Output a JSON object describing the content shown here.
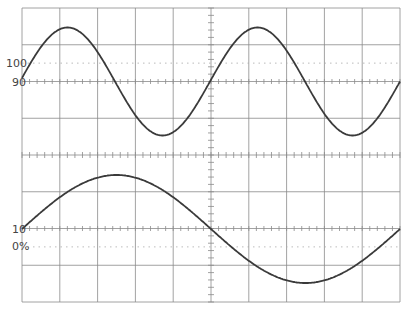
{
  "diagram": {
    "type": "oscilloscope-graticule",
    "grid": {
      "columns": 10,
      "rows": 8,
      "color": "#8a8a8a"
    },
    "labels": {
      "top_100": "100",
      "top_90": "90",
      "bottom_10": "10",
      "bottom_0": "0%"
    },
    "traces": [
      {
        "name": "upper-trace",
        "shape": "sine",
        "cycles_shown": 2,
        "color": "#3a3a3a"
      },
      {
        "name": "lower-trace",
        "shape": "sine",
        "cycles_shown": 1,
        "color": "#3a3a3a"
      }
    ]
  }
}
